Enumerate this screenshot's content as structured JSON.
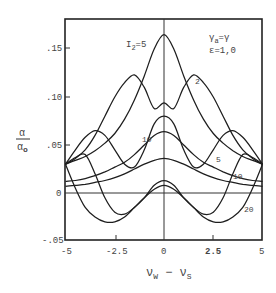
{
  "chart_data": {
    "type": "line",
    "title": "",
    "xlabel": "ν_W − ν_S",
    "ylabel": "α / α₀",
    "xlim": [
      -5,
      5
    ],
    "ylim": [
      -0.05,
      0.18
    ],
    "grid": false,
    "x_ticks": [
      "-5",
      "-2.5",
      "0",
      "2.5",
      "5"
    ],
    "y_ticks": [
      ".15",
      ".10",
      ".05",
      "0",
      "-.05"
    ],
    "annotations": [
      "γa=γ",
      "ε=1,0"
    ],
    "curve_labels": [
      "I₂=5",
      "2",
      "5",
      "10",
      "10",
      "20"
    ],
    "x": [
      -5,
      -4.5,
      -4,
      -3.5,
      -3,
      -2.5,
      -2,
      -1.5,
      -1,
      -0.5,
      0,
      0.5,
      1,
      1.5,
      2,
      2.5,
      3,
      3.5,
      4,
      4.5,
      5
    ],
    "series": [
      {
        "name": "I2=5 (top)",
        "values": [
          0.03,
          0.034,
          0.038,
          0.044,
          0.052,
          0.062,
          0.077,
          0.097,
          0.122,
          0.15,
          0.165,
          0.15,
          0.122,
          0.097,
          0.077,
          0.062,
          0.052,
          0.044,
          0.038,
          0.034,
          0.03
        ]
      },
      {
        "name": "I2=2",
        "values": [
          0.03,
          0.036,
          0.045,
          0.06,
          0.08,
          0.1,
          0.115,
          0.123,
          0.11,
          0.088,
          0.094,
          0.088,
          0.11,
          0.123,
          0.115,
          0.1,
          0.08,
          0.06,
          0.045,
          0.036,
          0.03
        ]
      },
      {
        "name": "I2=5",
        "values": [
          0.03,
          0.045,
          0.058,
          0.065,
          0.06,
          0.045,
          0.03,
          0.027,
          0.045,
          0.072,
          0.08,
          0.072,
          0.045,
          0.027,
          0.03,
          0.045,
          0.06,
          0.065,
          0.058,
          0.045,
          0.03
        ]
      },
      {
        "name": "I2=10",
        "values": [
          0.03,
          0.037,
          0.04,
          0.02,
          -0.005,
          -0.02,
          -0.022,
          -0.015,
          -0.005,
          0.008,
          0.013,
          0.008,
          -0.005,
          -0.015,
          -0.022,
          -0.02,
          -0.005,
          0.02,
          0.04,
          0.037,
          0.03
        ]
      },
      {
        "name": "I2=20",
        "values": [
          0.03,
          0.005,
          -0.015,
          -0.025,
          -0.03,
          -0.03,
          -0.025,
          -0.015,
          -0.005,
          0.004,
          0.008,
          0.004,
          -0.005,
          -0.015,
          -0.025,
          -0.03,
          -0.03,
          -0.025,
          -0.015,
          0.005,
          0.03
        ]
      },
      {
        "name": "background-1",
        "values": [
          0.012,
          0.013,
          0.015,
          0.018,
          0.022,
          0.027,
          0.032,
          0.04,
          0.05,
          0.06,
          0.064,
          0.06,
          0.05,
          0.04,
          0.032,
          0.027,
          0.022,
          0.018,
          0.015,
          0.013,
          0.012
        ]
      },
      {
        "name": "background-2",
        "values": [
          0.007,
          0.008,
          0.009,
          0.011,
          0.013,
          0.016,
          0.02,
          0.025,
          0.03,
          0.034,
          0.036,
          0.034,
          0.03,
          0.025,
          0.02,
          0.016,
          0.013,
          0.011,
          0.009,
          0.008,
          0.007
        ]
      }
    ]
  },
  "labels": {
    "ylabel_num": "α",
    "ylabel_den": "α",
    "ylabel_den_sub": "o",
    "xlabel_main": "ν",
    "xlabel_sub1": "W",
    "xlabel_minus": " − ν",
    "xlabel_sub2": "S",
    "ann1": "γ",
    "ann1_sub": "a",
    "ann1_rest": "=γ",
    "ann2": "ε=1,0",
    "curve_I2": "I",
    "curve_I2_sub": "2",
    "curve_I2_rest": "=5",
    "lbl_2": "2",
    "lbl_5": "5",
    "lbl_10a": "10",
    "lbl_10b": "10",
    "lbl_20": "20"
  }
}
